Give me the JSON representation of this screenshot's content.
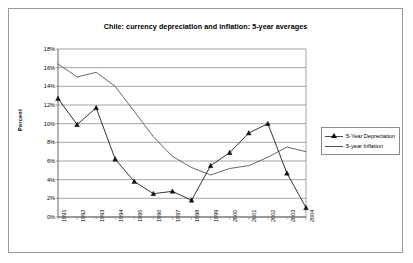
{
  "chart_data": {
    "type": "line",
    "title": "Chile: currency depreciation and inflation: 5-year averages",
    "xlabel": "",
    "ylabel": "Percent",
    "categories": [
      "1991",
      "1992",
      "1993",
      "1994",
      "1995",
      "1996",
      "1997",
      "1998",
      "1999",
      "2000",
      "2001",
      "2002",
      "2003",
      "2004"
    ],
    "ylim": [
      0,
      18
    ],
    "yticks": [
      "0%",
      "2%",
      "4%",
      "6%",
      "8%",
      "10%",
      "12%",
      "14%",
      "16%",
      "18%"
    ],
    "ytick_values": [
      0,
      2,
      4,
      6,
      8,
      10,
      12,
      14,
      16,
      18
    ],
    "grid": "horizontal",
    "legend_position": "right",
    "series": [
      {
        "name": "5-Year Depreciation",
        "marker": "triangle",
        "color": "#111111",
        "values": [
          12.7,
          9.9,
          11.7,
          6.2,
          3.8,
          2.5,
          2.75,
          1.8,
          5.5,
          6.9,
          9.0,
          10.0,
          4.7,
          1.0
        ]
      },
      {
        "name": "5-year Inflation",
        "marker": "none",
        "color": "#4d4d4d",
        "values": [
          16.4,
          15.0,
          15.5,
          14.0,
          11.3,
          8.6,
          6.5,
          5.3,
          4.5,
          5.2,
          5.5,
          6.4,
          7.5,
          7.0
        ]
      }
    ]
  },
  "legend": {
    "items": [
      {
        "label": "5-Year Depreciation"
      },
      {
        "label": "5-year Inflation"
      }
    ]
  }
}
